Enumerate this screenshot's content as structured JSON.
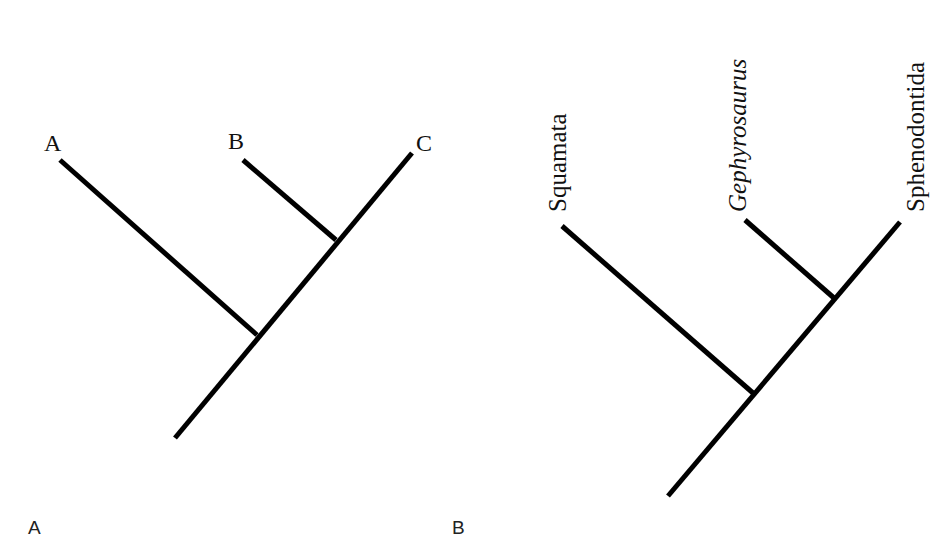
{
  "figure": {
    "panels": [
      {
        "id": "A",
        "panel_label": "A",
        "tips": [
          {
            "label": "A",
            "italic": false
          },
          {
            "label": "B",
            "italic": false
          },
          {
            "label": "C",
            "italic": false
          }
        ],
        "topology": "(A,(B,C))"
      },
      {
        "id": "B",
        "panel_label": "B",
        "tips": [
          {
            "label": "Squamata",
            "italic": false
          },
          {
            "label": "Gephyrosaurus",
            "italic": true
          },
          {
            "label": "Sphenodontida",
            "italic": false
          }
        ],
        "topology": "(Squamata,(Gephyrosaurus,Sphenodontida))"
      }
    ],
    "line_color": "#000000",
    "background": "#ffffff"
  }
}
